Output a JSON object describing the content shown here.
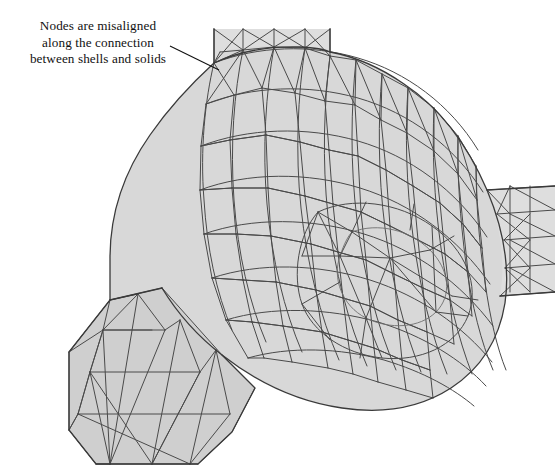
{
  "figure": {
    "name": "fe-mesh-shell-solid-connection",
    "background_color": "#ffffff",
    "width": 555,
    "height": 472
  },
  "annotation": {
    "name": "misalignment-callout",
    "lines": [
      "Nodes are misaligned",
      "along the connection",
      "between shells and solids"
    ],
    "text_color": "#111111",
    "leader": {
      "from_x": 170,
      "from_y": 46,
      "to_x": 219,
      "to_y": 70,
      "color": "#111111",
      "width": 1.1
    }
  },
  "mesh": {
    "fill_color": "#d8d8d8",
    "fill_color_shaded": "#cfcfcf",
    "fill_color_light": "#dedede",
    "edge_color": "#4a4a4a",
    "edge_color_soft": "#6e6e6e",
    "silhouette_color": "#3a3a3a",
    "edge_width": 1.0,
    "silhouette_width": 1.25,
    "parts": [
      {
        "name": "cylinder-solid-body",
        "type": "solid",
        "description": "Curved cylindrical solid meshed with triangles"
      },
      {
        "name": "upper-shell-tab",
        "type": "shell",
        "description": "Vertical shell strip entering the top of the cylinder"
      },
      {
        "name": "lower-left-shell-panel",
        "type": "shell",
        "description": "Flat shell panel attached at the lower left"
      },
      {
        "name": "right-flange-shell",
        "type": "shell",
        "description": "Narrow shell tab running off the right edge"
      },
      {
        "name": "hub-ellipse-region",
        "type": "solid",
        "description": "Elliptical hub face on the right end of the cylinder"
      }
    ]
  }
}
